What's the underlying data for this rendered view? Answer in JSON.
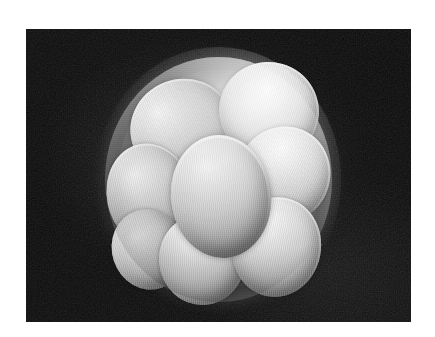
{
  "figure": {
    "kind": "scanning-electron-micrograph",
    "alt_text": "Scanning electron micrograph of an eight-cell stage embryo: rounded blastomeres packed inside a smooth translucent zona pellucida, photographed against a black background.",
    "width_px": 435,
    "height_px": 337,
    "page_background": "#ffffff",
    "plate": {
      "label": "micrograph-plate",
      "left_px": 26,
      "top_px": 29,
      "width_px": 385,
      "height_px": 293,
      "background_color": "#060606",
      "border_color": "#ffffff",
      "glow_color": "#565656"
    },
    "specimen": {
      "label": "embryo",
      "center_x_px": 218,
      "center_y_px": 180,
      "diameter_px": 227,
      "shell_name": "zona pellucida",
      "shell_highlight_color": "#ffffff",
      "shell_shadow_color": "#4a4a4a",
      "cell_count_visible": 8,
      "cell_highlight_color": "#f4f4f4",
      "cell_midtone_color": "#c8c8c8",
      "cell_shadow_color": "#6f6f6f",
      "blastomeres": [
        {
          "name": "blastomere-upper-left",
          "left_pct": 11.0,
          "top_pct": 9.0,
          "width_pct": 46.0,
          "height_pct": 40.0,
          "rotate_deg": -22
        },
        {
          "name": "blastomere-upper-right",
          "left_pct": 50.0,
          "top_pct": 2.0,
          "width_pct": 44.0,
          "height_pct": 40.0,
          "rotate_deg": 16
        },
        {
          "name": "blastomere-center",
          "left_pct": 29.0,
          "top_pct": 32.0,
          "width_pct": 44.0,
          "height_pct": 50.0,
          "rotate_deg": -6
        },
        {
          "name": "blastomere-left",
          "left_pct": 1.0,
          "top_pct": 35.0,
          "width_pct": 38.0,
          "height_pct": 43.0,
          "rotate_deg": -12
        },
        {
          "name": "blastomere-right",
          "left_pct": 58.0,
          "top_pct": 28.0,
          "width_pct": 41.0,
          "height_pct": 40.0,
          "rotate_deg": 24
        },
        {
          "name": "blastomere-lower-right",
          "left_pct": 56.0,
          "top_pct": 57.0,
          "width_pct": 39.0,
          "height_pct": 41.0,
          "rotate_deg": 10
        },
        {
          "name": "blastomere-lower-center",
          "left_pct": 24.0,
          "top_pct": 64.0,
          "width_pct": 38.0,
          "height_pct": 37.0,
          "rotate_deg": -4
        },
        {
          "name": "blastomere-lower-left",
          "left_pct": 3.0,
          "top_pct": 62.0,
          "width_pct": 32.0,
          "height_pct": 33.0,
          "rotate_deg": -18
        }
      ]
    }
  }
}
